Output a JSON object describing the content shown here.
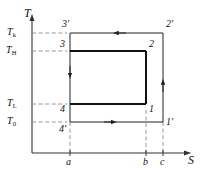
{
  "figure": {
    "kind": "temperature-entropy-cycle-diagram",
    "axes": {
      "y_label": "T",
      "x_label": "S"
    },
    "temperature_levels": [
      {
        "id": "Tk",
        "base": "T",
        "sub": "k",
        "y": 33
      },
      {
        "id": "TH",
        "base": "T",
        "sub": "H",
        "y": 51
      },
      {
        "id": "TL",
        "base": "T",
        "sub": "L",
        "y": 104
      },
      {
        "id": "T0",
        "base": "T",
        "sub": "0",
        "y": 122
      }
    ],
    "entropy_ticks": [
      {
        "label": "a",
        "x": 70
      },
      {
        "label": "b",
        "x": 146
      },
      {
        "label": "c",
        "x": 163
      }
    ],
    "state_points": [
      {
        "label": "1",
        "x": 149,
        "y": 110
      },
      {
        "label": "2",
        "x": 149,
        "y": 46
      },
      {
        "label": "3",
        "x": 67,
        "y": 46
      },
      {
        "label": "4",
        "x": 67,
        "y": 110
      },
      {
        "label": "1'",
        "x": 166,
        "y": 128
      },
      {
        "label": "2'",
        "x": 166,
        "y": 28
      },
      {
        "label": "3'",
        "x": 67,
        "y": 28
      },
      {
        "label": "4'",
        "x": 67,
        "y": 128
      }
    ],
    "arrows": [
      {
        "name": "top-leftward",
        "direction": "left",
        "on": "2prime-to-3prime"
      },
      {
        "name": "bottom-rightward",
        "direction": "right",
        "on": "4prime-to-1prime"
      },
      {
        "name": "left-downward",
        "direction": "down",
        "on": "3-to-4"
      },
      {
        "name": "right-upward",
        "direction": "up",
        "on": "1prime-to-2prime"
      }
    ],
    "colors": {
      "line": "#222222",
      "bold_line": "#111111",
      "dash": "#777777",
      "axis": "#333333",
      "text": "#111111"
    }
  }
}
